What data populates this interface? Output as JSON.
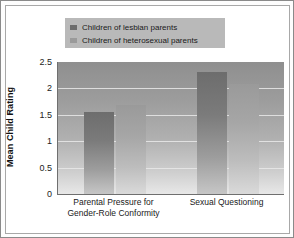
{
  "chart_data": {
    "type": "bar",
    "title": "",
    "xlabel": "",
    "ylabel": "Mean Child Rating",
    "categories": [
      "Parental Pressure for\nGender-Role Conformity",
      "Sexual Questioning"
    ],
    "series": [
      {
        "name": "Children of lesbian parents",
        "color": "#6d6d6d",
        "values": [
          1.55,
          2.31
        ]
      },
      {
        "name": "Children of heterosexual parents",
        "color": "#9a9a9a",
        "values": [
          1.68,
          2.08
        ]
      }
    ],
    "ylim": [
      0,
      2.5
    ],
    "yticks": [
      "0",
      "0.5",
      "1",
      "1.5",
      "2",
      "2.5"
    ],
    "ytick_values": [
      0,
      0.5,
      1,
      1.5,
      2,
      2.5
    ],
    "grid": true,
    "gridlines_at": [
      0.5,
      1,
      1.5,
      2
    ],
    "legend_position": "top-center",
    "legend_background": "#b9b9b9",
    "plot_background": "#a8a8a8",
    "frame_border_color": "#8a8a8a"
  }
}
